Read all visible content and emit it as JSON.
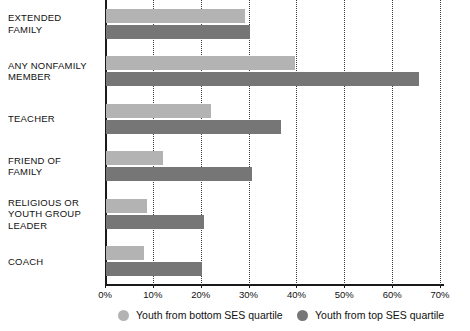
{
  "chart_data": {
    "type": "bar",
    "orientation": "horizontal",
    "title": "",
    "xlabel": "",
    "ylabel": "",
    "xlim": [
      0,
      70
    ],
    "grid": true,
    "grid_style": "dotted-vertical",
    "legend_position": "bottom",
    "categories": [
      "EXTENDED\nFAMILY",
      "ANY NONFAMILY\nMEMBER",
      "TEACHER",
      "FRIEND OF\nFAMILY",
      "RELIGIOUS OR\nYOUTH GROUP\nLEADER",
      "COACH"
    ],
    "tick_labels": [
      "0%",
      "10%",
      "20%",
      "30%",
      "40%",
      "50%",
      "60%",
      "70%"
    ],
    "tick_values": [
      0,
      10,
      20,
      30,
      40,
      50,
      60,
      70
    ],
    "series": [
      {
        "name": "Youth from bottom SES quartile",
        "color": "#b3b3b3",
        "values": [
          29,
          39.5,
          22,
          12,
          8.5,
          8
        ]
      },
      {
        "name": "Youth from top SES quartile",
        "color": "#767676",
        "values": [
          30,
          65.5,
          36.5,
          30.5,
          20.5,
          20
        ]
      }
    ]
  },
  "legend": {
    "items": [
      {
        "label": "Youth from bottom SES quartile",
        "marker": "circle-light-gray"
      },
      {
        "label": "Youth from top SES quartile",
        "marker": "circle-dark-gray"
      }
    ]
  },
  "colors": {
    "bottom_ses": "#b3b3b3",
    "top_ses": "#767676",
    "axis": "#1a1a1a",
    "grid": "#3a3a3a",
    "background": "#ffffff"
  }
}
